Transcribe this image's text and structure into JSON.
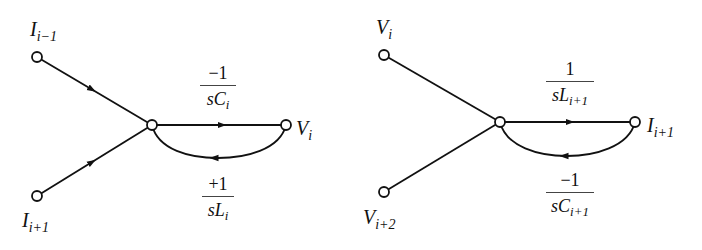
{
  "diagrams": [
    {
      "name": "left-signal-flow-graph",
      "nodes": {
        "top": {
          "var": "I",
          "sub": "i−1"
        },
        "bottom": {
          "var": "I",
          "sub": "i+1"
        },
        "output": {
          "var": "V",
          "sub": "i"
        }
      },
      "forward_gain": {
        "num": "−1",
        "den_var": "sC",
        "den_sub": "i"
      },
      "feedback_gain": {
        "num": "+1",
        "den_var": "sL",
        "den_sub": "i"
      }
    },
    {
      "name": "right-signal-flow-graph",
      "nodes": {
        "top": {
          "var": "V",
          "sub": "i"
        },
        "bottom": {
          "var": "V",
          "sub": "i+2"
        },
        "output": {
          "var": "I",
          "sub": "i+1"
        }
      },
      "forward_gain": {
        "num": "1",
        "den_var": "sL",
        "den_sub": "i+1"
      },
      "feedback_gain": {
        "num": "−1",
        "den_var": "sC",
        "den_sub": "i+1"
      }
    }
  ],
  "colors": {
    "stroke": "#111111",
    "background": "#ffffff"
  }
}
